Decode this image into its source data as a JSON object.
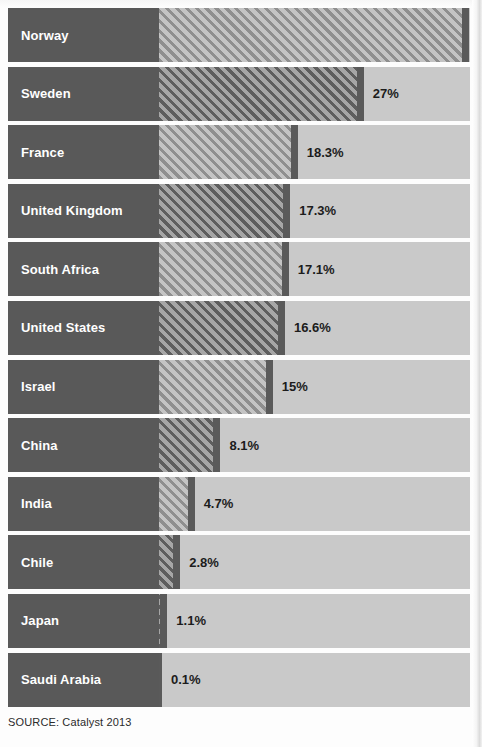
{
  "chart_data": {
    "type": "bar",
    "orientation": "horizontal",
    "title": "",
    "subtitle": "",
    "xlabel": "",
    "ylabel": "",
    "xlim": [
      0,
      41
    ],
    "grid": false,
    "legend": null,
    "value_suffix": "%",
    "categories": [
      "Norway",
      "Sweden",
      "France",
      "United Kingdom",
      "South Africa",
      "United States",
      "Israel",
      "China",
      "India",
      "Chile",
      "Japan",
      "Saudi Arabia"
    ],
    "values": [
      40.9,
      27,
      18.3,
      17.3,
      17.1,
      16.6,
      15,
      8.1,
      4.7,
      2.8,
      1.1,
      0.1
    ],
    "value_labels": [
      "40.9%",
      "27%",
      "18.3%",
      "17.3%",
      "17.1%",
      "16.6%",
      "15%",
      "8.1%",
      "4.7%",
      "2.8%",
      "1.1%",
      "0.1%"
    ],
    "rows": [
      {
        "label": "Norway",
        "value": 40.9,
        "value_label": "40.9%",
        "hatch": "hatch-light"
      },
      {
        "label": "Sweden",
        "value": 27,
        "value_label": "27%",
        "hatch": "hatch-dark"
      },
      {
        "label": "France",
        "value": 18.3,
        "value_label": "18.3%",
        "hatch": "hatch-light"
      },
      {
        "label": "United Kingdom",
        "value": 17.3,
        "value_label": "17.3%",
        "hatch": "hatch-dark"
      },
      {
        "label": "South Africa",
        "value": 17.1,
        "value_label": "17.1%",
        "hatch": "hatch-light"
      },
      {
        "label": "United States",
        "value": 16.6,
        "value_label": "16.6%",
        "hatch": "hatch-dark"
      },
      {
        "label": "Israel",
        "value": 15,
        "value_label": "15%",
        "hatch": "hatch-light"
      },
      {
        "label": "China",
        "value": 8.1,
        "value_label": "8.1%",
        "hatch": "hatch-dark"
      },
      {
        "label": "India",
        "value": 4.7,
        "value_label": "4.7%",
        "hatch": "hatch-light"
      },
      {
        "label": "Chile",
        "value": 2.8,
        "value_label": "2.8%",
        "hatch": "hatch-dark"
      },
      {
        "label": "Japan",
        "value": 1.1,
        "value_label": "1.1%",
        "hatch": "hatch-dark"
      },
      {
        "label": "Saudi Arabia",
        "value": 0.1,
        "value_label": "0.1%",
        "hatch": "hatch-dark"
      }
    ]
  },
  "footer": {
    "source": "SOURCE: Catalyst 2013"
  },
  "colors": {
    "label_background": "#595959",
    "label_text": "#ffffff",
    "track": "#c9c9c9",
    "bar_cap": "#5a5a5a",
    "hatch_light_line": "#8f8f8f",
    "hatch_light_gap": "#c4c4c4",
    "hatch_dark_line": "#5e5e5e",
    "hatch_dark_gap": "#a6a6a6",
    "value_text": "#1c1c1c",
    "page_background": "#fdfdfd"
  }
}
